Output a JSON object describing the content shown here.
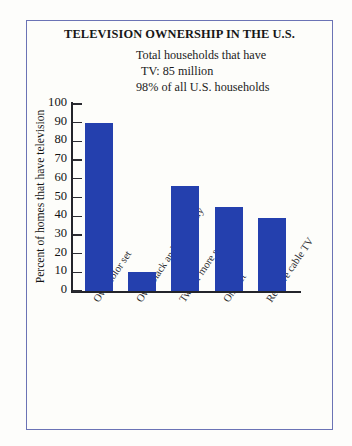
{
  "frame": {
    "border_color": "#6b73b5",
    "background_color": "#fdfdfa"
  },
  "annotation": {
    "line1": "Total households that have",
    "line2": "TV: 85 million",
    "line3": "98% of all U.S. households"
  },
  "chart_data": {
    "type": "bar",
    "title": "TELEVISION OWNERSHIP IN THE U.S.",
    "xlabel": "",
    "ylabel": "Percent of homes that have television",
    "categories": [
      "Own color set",
      "Own black and white only",
      "Two or more sets",
      "One set",
      "Receive cable TV"
    ],
    "values": [
      90,
      10,
      56,
      45,
      39
    ],
    "ylim": [
      0,
      100
    ],
    "yticks": [
      0,
      10,
      20,
      30,
      40,
      50,
      60,
      70,
      80,
      90,
      100
    ],
    "ytick_labels": [
      "0",
      "10",
      "20",
      "30",
      "40",
      "50",
      "60",
      "70",
      "80",
      "90",
      "100"
    ],
    "grid": false,
    "legend": null,
    "bar_color": "#2440ae",
    "axis_color": "#23242a"
  }
}
